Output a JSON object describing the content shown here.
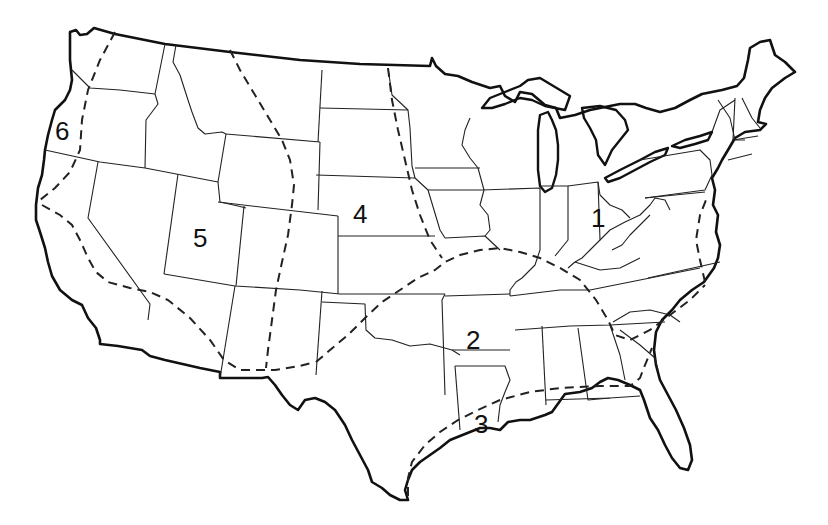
{
  "map": {
    "subject": "Contiguous United States divided into numbered regions",
    "style": "black-and-white line drawing",
    "colors": {
      "outline": "#111111",
      "background": "#ffffff"
    },
    "legend": {
      "solid_thick": "national coastline / border",
      "solid_thin": "state boundaries",
      "dashed": "region boundaries"
    },
    "regions": [
      {
        "id": 1,
        "label": "1",
        "location": "Ohio / Ohio Valley (Northeast & Midwest)"
      },
      {
        "id": 2,
        "label": "2",
        "location": "Arkansas (South-Central)"
      },
      {
        "id": 3,
        "label": "3",
        "location": "Louisiana (Gulf Coast)"
      },
      {
        "id": 4,
        "label": "4",
        "location": "Nebraska (Great Plains)"
      },
      {
        "id": 5,
        "label": "5",
        "location": "Utah (Intermountain West)"
      },
      {
        "id": 6,
        "label": "6",
        "location": "Oregon coast (Pacific Northwest)"
      }
    ]
  }
}
